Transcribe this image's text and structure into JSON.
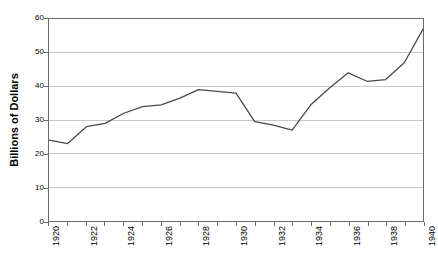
{
  "chart_data": {
    "type": "line",
    "title": "",
    "subtitle": "",
    "xlabel": "",
    "ylabel": "Billions of Dollars",
    "x": [
      1920,
      1921,
      1922,
      1923,
      1924,
      1925,
      1926,
      1927,
      1928,
      1929,
      1930,
      1931,
      1932,
      1933,
      1934,
      1935,
      1936,
      1937,
      1938,
      1939,
      1940
    ],
    "values": [
      24,
      23,
      28,
      29,
      32,
      34,
      34.5,
      36.5,
      39,
      38.5,
      38,
      29.5,
      28.5,
      27,
      34.5,
      39.5,
      44,
      41.5,
      42,
      47,
      57
    ],
    "series": [
      {
        "name": "Billions of Dollars",
        "values": [
          24,
          23,
          28,
          29,
          32,
          34,
          34.5,
          36.5,
          39,
          38.5,
          38,
          29.5,
          28.5,
          27,
          34.5,
          39.5,
          44,
          41.5,
          42,
          47,
          57
        ]
      }
    ],
    "xlim": [
      1920,
      1940
    ],
    "ylim": [
      0,
      60
    ],
    "x_tick_labels": [
      "1920",
      "1922",
      "1924",
      "1926",
      "1928",
      "1930",
      "1932",
      "1934",
      "1936",
      "1938",
      "1940"
    ],
    "x_tick_values": [
      1920,
      1922,
      1924,
      1926,
      1928,
      1930,
      1932,
      1934,
      1936,
      1938,
      1940
    ],
    "y_tick_labels": [
      "0",
      "10",
      "20",
      "30",
      "40",
      "50",
      "60"
    ],
    "y_tick_values": [
      0,
      10,
      20,
      30,
      40,
      50,
      60
    ],
    "grid": "horizontal",
    "legend": "none",
    "line_color": "#4a4a4a",
    "grid_color": "#c8c8c8",
    "axis_color": "#6b6b6b",
    "background_color": "#ffffff"
  }
}
